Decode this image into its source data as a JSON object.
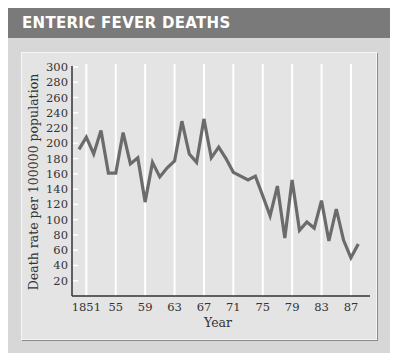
{
  "header": {
    "title": "ENTERIC FEVER DEATHS"
  },
  "colors": {
    "titlebar": "#7a7a7a",
    "frame": "#d7d7d7",
    "plot_bg": "#e4e4e4",
    "line": "#6b6b6b",
    "grid": "#ffffff"
  },
  "chart_data": {
    "type": "line",
    "title": "ENTERIC FEVER DEATHS",
    "xlabel": "Year",
    "ylabel": "Death rate per 100000 population",
    "x_tick_labels": [
      "1851",
      "55",
      "59",
      "63",
      "67",
      "71",
      "75",
      "79",
      "83",
      "87"
    ],
    "y_tick_labels": [
      "20",
      "40",
      "60",
      "80",
      "100",
      "120",
      "140",
      "160",
      "180",
      "200",
      "220",
      "240",
      "260",
      "280",
      "300"
    ],
    "ylim": [
      0,
      300
    ],
    "xlim": [
      1850,
      1888
    ],
    "grid": {
      "vertical": true,
      "horizontal": false
    },
    "legend": null,
    "series": [
      {
        "name": "Enteric fever death rate",
        "x": [
          1850,
          1851,
          1852,
          1853,
          1854,
          1855,
          1856,
          1857,
          1858,
          1859,
          1860,
          1861,
          1862,
          1863,
          1864,
          1865,
          1866,
          1867,
          1868,
          1869,
          1870,
          1871,
          1872,
          1873,
          1874,
          1875,
          1876,
          1877,
          1878,
          1879,
          1880,
          1881,
          1882,
          1883,
          1884,
          1885,
          1886,
          1887,
          1888
        ],
        "values": [
          192,
          208,
          186,
          217,
          161,
          161,
          214,
          173,
          181,
          123,
          175,
          156,
          168,
          177,
          229,
          186,
          175,
          232,
          181,
          195,
          180,
          162,
          157,
          152,
          157,
          131,
          105,
          144,
          76,
          152,
          86,
          97,
          89,
          125,
          72,
          114,
          73,
          50,
          68
        ]
      }
    ]
  }
}
